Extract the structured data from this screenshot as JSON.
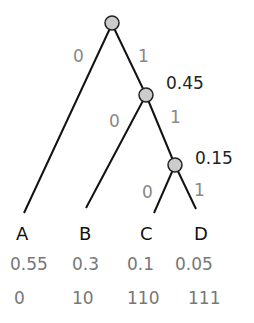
{
  "diagram": {
    "type": "huffman-tree",
    "internal_nodes": [
      {
        "id": "root",
        "value": ""
      },
      {
        "id": "n045",
        "value": "0.45"
      },
      {
        "id": "n015",
        "value": "0.15"
      }
    ],
    "edges": [
      {
        "from": "root",
        "to": "A",
        "label": "0"
      },
      {
        "from": "root",
        "to": "n045",
        "label": "1"
      },
      {
        "from": "n045",
        "to": "B",
        "label": "0"
      },
      {
        "from": "n045",
        "to": "n015",
        "label": "1"
      },
      {
        "from": "n015",
        "to": "C",
        "label": "0"
      },
      {
        "from": "n015",
        "to": "D",
        "label": "1"
      }
    ],
    "leaves": [
      {
        "name": "A",
        "prob": "0.55",
        "code": "0"
      },
      {
        "name": "B",
        "prob": "0.3",
        "code": "10"
      },
      {
        "name": "C",
        "prob": "0.1",
        "code": "110"
      },
      {
        "name": "D",
        "prob": "0.05",
        "code": "111"
      }
    ],
    "colors": {
      "node_fill": "#cccccc",
      "line": "#111111",
      "label": "#888888"
    }
  }
}
